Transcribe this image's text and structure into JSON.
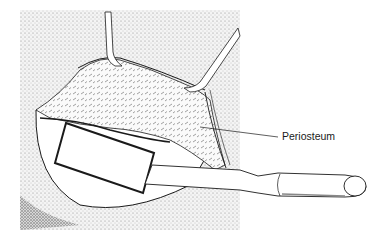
{
  "figure": {
    "type": "surgical-illustration",
    "labels": [
      {
        "text": "Periosteum",
        "target": "periosteum-layer"
      }
    ],
    "colors": {
      "ink": "#1a1a1a",
      "background": "#ffffff",
      "stipple": "#8a8a8a"
    }
  }
}
